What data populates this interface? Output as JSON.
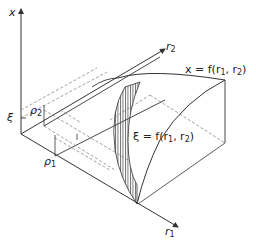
{
  "figure": {
    "axes": {
      "vertical": "x",
      "r1": "r",
      "r1_sub": "1",
      "r2": "r",
      "r2_sub": "2"
    },
    "labels": {
      "xi": "ξ",
      "rho1": "ρ",
      "rho1_sub": "1",
      "rho2": "ρ",
      "rho2_sub": "2"
    },
    "surfaces": {
      "top_prefix": "x = f(r",
      "top_mid": ", r",
      "top_suffix": ")",
      "top_sub1": "1",
      "top_sub2": "2",
      "bottom_prefix": "ξ = f(r",
      "bottom_mid": ", r",
      "bottom_suffix": ")",
      "bottom_sub1": "1",
      "bottom_sub2": "2"
    },
    "colors": {
      "line": "#333333",
      "dashed": "#777777",
      "hatch": "#444444"
    }
  }
}
